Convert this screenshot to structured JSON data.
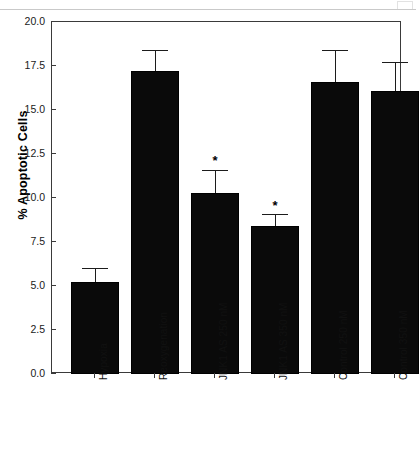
{
  "artifact": {
    "ghost_text": "",
    "note": "faint scanned page-header smudge, illegible"
  },
  "chart_data": {
    "type": "bar",
    "title": "",
    "subtitle": "",
    "xlabel": "",
    "ylabel": "% Apoptotic Cells",
    "ylim": [
      0.0,
      20.0
    ],
    "ytick_step": 2.5,
    "ytick_labels": [
      "0.0",
      "2.5",
      "5.0",
      "7.5",
      "10.0",
      "12.5",
      "15.0",
      "17.5",
      "20.0"
    ],
    "ytick_values": [
      0.0,
      2.5,
      5.0,
      7.5,
      10.0,
      12.5,
      15.0,
      17.5,
      20.0
    ],
    "grid": false,
    "legend": null,
    "bar_color": "#0a0a0a",
    "axis_color": "#3a3a3a",
    "categories": [
      "Hypoxia",
      "Reoxygenation",
      "JNK1 AS 250 nM",
      "JNK1 AS 350 nM",
      "Control  250 nM",
      "Control  350 nM"
    ],
    "values": [
      5.2,
      17.2,
      10.3,
      8.4,
      16.6,
      16.1
    ],
    "errors_upper": [
      0.8,
      1.2,
      1.3,
      0.7,
      1.8,
      1.6
    ],
    "error_cap_values": [
      6.0,
      18.4,
      11.6,
      9.1,
      18.4,
      17.7
    ],
    "annotations": [
      {
        "category": "JNK1 AS 250 nM",
        "symbol": "*",
        "at_value": 12.3
      },
      {
        "category": "JNK1 AS 350 nM",
        "symbol": "*",
        "at_value": 9.7
      }
    ],
    "bars": [
      {
        "label": "Hypoxia",
        "value": 5.2,
        "error_top": 6.0,
        "star": false,
        "x_left_pct": 5.43,
        "width_pct": 13.71
      },
      {
        "label": "Reoxygenation",
        "value": 17.2,
        "error_top": 18.4,
        "star": false,
        "x_left_pct": 22.57,
        "width_pct": 13.71
      },
      {
        "label": "JNK1 AS 250 nM",
        "value": 10.3,
        "error_top": 11.6,
        "star": true,
        "x_left_pct": 39.71,
        "width_pct": 13.71
      },
      {
        "label": "JNK1 AS 350 nM",
        "value": 8.4,
        "error_top": 9.1,
        "star": true,
        "x_left_pct": 56.86,
        "width_pct": 13.71
      },
      {
        "label": "Control  250 nM",
        "value": 16.6,
        "error_top": 18.4,
        "star": false,
        "x_left_pct": 74.0,
        "width_pct": 13.71
      },
      {
        "label": "Control  350 nM",
        "value": 16.1,
        "error_top": 17.7,
        "star": false,
        "x_left_pct": 91.14,
        "width_pct": 13.71
      }
    ],
    "star_symbol": "*"
  }
}
